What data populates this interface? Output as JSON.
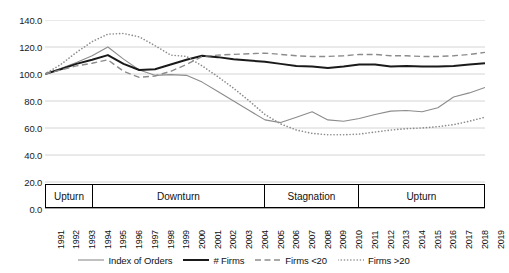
{
  "chart_data": {
    "type": "line",
    "title": "",
    "xlabel": "",
    "ylabel": "",
    "ylim": [
      0,
      140
    ],
    "yticks": [
      "0.0",
      "20.0",
      "40.0",
      "60.0",
      "80.0",
      "100.0",
      "120.0",
      "140.0"
    ],
    "ytick_values": [
      0,
      20,
      40,
      60,
      80,
      100,
      120,
      140
    ],
    "grid": true,
    "legend_position": "bottom",
    "x": [
      1991,
      1992,
      1993,
      1994,
      1995,
      1996,
      1997,
      1998,
      1999,
      2000,
      2001,
      2002,
      2003,
      2004,
      2005,
      2006,
      2007,
      2008,
      2009,
      2010,
      2011,
      2012,
      2013,
      2014,
      2015,
      2016,
      2017,
      2018,
      2019
    ],
    "categories": [
      "1991",
      "1992",
      "1993",
      "1994",
      "1995",
      "1996",
      "1997",
      "1998",
      "1999",
      "2000",
      "2001",
      "2002",
      "2003",
      "2004",
      "2005",
      "2006",
      "2007",
      "2008",
      "2009",
      "2010",
      "2011",
      "2012",
      "2013",
      "2014",
      "2015",
      "2016",
      "2017",
      "2018",
      "2019"
    ],
    "series": [
      {
        "name": "Index of Orders",
        "style": "solid",
        "color": "#8c8c8c",
        "width": 1.1,
        "values": [
          100.0,
          104.0,
          108.5,
          113.5,
          120.0,
          111.0,
          103.0,
          99.0,
          99.5,
          99.0,
          94.0,
          87.0,
          80.0,
          73.0,
          66.0,
          64.0,
          68.0,
          72.0,
          66.0,
          65.0,
          67.0,
          70.0,
          72.5,
          73.0,
          72.0,
          75.0,
          83.0,
          86.0,
          90.0
        ]
      },
      {
        "name": "# Firms",
        "style": "solid",
        "color": "#1a1a1a",
        "width": 2.0,
        "values": [
          100.0,
          103.5,
          107.5,
          110.5,
          114.0,
          107.5,
          103.0,
          103.5,
          107.0,
          110.5,
          113.5,
          112.5,
          111.0,
          110.0,
          109.0,
          107.5,
          106.0,
          105.5,
          104.5,
          105.5,
          107.0,
          107.0,
          105.5,
          106.0,
          105.5,
          105.5,
          106.0,
          107.0,
          108.0
        ]
      },
      {
        "name": "Firms <20",
        "style": "dashed",
        "color": "#8c8c8c",
        "width": 1.4,
        "values": [
          100.0,
          103.0,
          106.0,
          108.0,
          110.5,
          102.0,
          97.5,
          98.5,
          102.0,
          107.0,
          113.0,
          114.0,
          114.5,
          115.0,
          115.5,
          114.5,
          113.5,
          113.0,
          113.0,
          113.5,
          114.5,
          114.5,
          113.5,
          113.5,
          113.0,
          113.0,
          113.5,
          114.5,
          116.0
        ]
      },
      {
        "name": "Firms >20",
        "style": "dotted",
        "color": "#8c8c8c",
        "width": 1.6,
        "values": [
          100.0,
          107.0,
          116.0,
          124.0,
          129.5,
          130.0,
          127.5,
          121.0,
          114.0,
          113.0,
          106.0,
          98.0,
          89.5,
          80.0,
          70.0,
          63.0,
          58.5,
          56.0,
          55.0,
          55.0,
          55.5,
          57.0,
          58.5,
          59.5,
          60.0,
          61.0,
          62.5,
          65.0,
          68.0
        ]
      }
    ],
    "phases": [
      {
        "label": "Upturn",
        "start": 1991,
        "end": 1994
      },
      {
        "label": "Downturn",
        "start": 1994,
        "end": 2005
      },
      {
        "label": "Stagnation",
        "start": 2005,
        "end": 2011
      },
      {
        "label": "Upturn",
        "start": 2011,
        "end": 2019
      }
    ]
  }
}
